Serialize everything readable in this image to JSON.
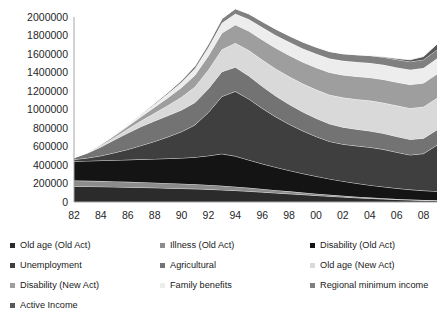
{
  "chart_data": {
    "type": "area",
    "stacked": true,
    "title": "",
    "subtitle": "",
    "xlabel": "",
    "ylabel": "",
    "grid": false,
    "legend_position": "bottom",
    "ylim": [
      0,
      2000000
    ],
    "yticks": [
      0,
      200000,
      400000,
      600000,
      800000,
      1000000,
      1200000,
      1400000,
      1600000,
      1800000,
      2000000
    ],
    "ytick_labels": [
      "0",
      "200000",
      "400000",
      "600000",
      "800000",
      "1000000",
      "1200000",
      "1400000",
      "1600000",
      "1800000",
      "2000000"
    ],
    "x": [
      1982,
      1983,
      1984,
      1985,
      1986,
      1987,
      1988,
      1989,
      1990,
      1991,
      1992,
      1993,
      1994,
      1995,
      1996,
      1997,
      1998,
      1999,
      2000,
      2001,
      2002,
      2003,
      2004,
      2005,
      2006,
      2007,
      2008,
      2009
    ],
    "xtick_labels": [
      "82",
      "84",
      "86",
      "88",
      "90",
      "92",
      "94",
      "96",
      "98",
      "00",
      "02",
      "04",
      "06",
      "08"
    ],
    "xtick_values": [
      1982,
      1984,
      1986,
      1988,
      1990,
      1992,
      1994,
      1996,
      1998,
      2000,
      2002,
      2004,
      2006,
      2008
    ],
    "series": [
      {
        "name": "Old age (Old Act)",
        "color": "#2b2b2b",
        "values": [
          170000,
          168000,
          166000,
          163000,
          160000,
          157000,
          154000,
          150000,
          146000,
          142000,
          137000,
          131000,
          124000,
          116000,
          107000,
          98000,
          89000,
          80000,
          71000,
          62000,
          54000,
          46000,
          39000,
          33000,
          27000,
          22000,
          18000,
          15000
        ]
      },
      {
        "name": "Illness (Old Act)",
        "color": "#8c8c8c",
        "values": [
          62000,
          61000,
          60000,
          59000,
          58000,
          57000,
          55000,
          54000,
          52000,
          50000,
          48000,
          45000,
          42000,
          38000,
          34000,
          30000,
          26000,
          22000,
          19000,
          16000,
          13000,
          11000,
          9000,
          7500,
          6000,
          5000,
          4000,
          3500
        ]
      },
      {
        "name": "Disability (Old Act)",
        "color": "#141414",
        "values": [
          208000,
          215000,
          222000,
          230000,
          238000,
          247000,
          256000,
          266000,
          277000,
          292000,
          315000,
          345000,
          330000,
          300000,
          272000,
          248000,
          226000,
          206000,
          188000,
          172000,
          158000,
          145000,
          134000,
          124000,
          115000,
          107000,
          101000,
          97000
        ]
      },
      {
        "name": "Unemployment",
        "color": "#3f3f3f",
        "values": [
          20000,
          32000,
          52000,
          80000,
          112000,
          150000,
          190000,
          235000,
          285000,
          350000,
          470000,
          620000,
          700000,
          660000,
          600000,
          545000,
          500000,
          462000,
          430000,
          405000,
          400000,
          405000,
          410000,
          405000,
          390000,
          375000,
          400000,
          500000
        ]
      },
      {
        "name": "Agricultural",
        "color": "#737373",
        "values": [
          18000,
          52000,
          95000,
          140000,
          178000,
          205000,
          222000,
          230000,
          235000,
          242000,
          255000,
          268000,
          262000,
          250000,
          238000,
          226000,
          215000,
          205000,
          197000,
          190000,
          184000,
          180000,
          176000,
          173000,
          170000,
          168000,
          166000,
          165000
        ]
      },
      {
        "name": "Old age (New Act)",
        "color": "#d9d9d9",
        "values": [
          2000,
          6000,
          14000,
          26000,
          42000,
          62000,
          86000,
          112000,
          140000,
          170000,
          205000,
          240000,
          262000,
          276000,
          286000,
          294000,
          300000,
          305000,
          310000,
          315000,
          320000,
          324000,
          328000,
          331000,
          334000,
          337000,
          340000,
          344000
        ]
      },
      {
        "name": "Disability (New Act)",
        "color": "#9e9e9e",
        "values": [
          1000,
          4000,
          10000,
          19000,
          31000,
          46000,
          63000,
          82000,
          103000,
          126000,
          152000,
          178000,
          196000,
          208000,
          217000,
          224000,
          230000,
          234000,
          238000,
          241000,
          244000,
          247000,
          249000,
          251000,
          253000,
          255000,
          257000,
          260000
        ]
      },
      {
        "name": "Family benefits",
        "color": "#ededed",
        "values": [
          0,
          1000,
          3000,
          7000,
          13000,
          21000,
          31000,
          43000,
          57000,
          72000,
          90000,
          108000,
          120000,
          128000,
          134000,
          139000,
          143000,
          146000,
          149000,
          151000,
          153000,
          155000,
          157000,
          158000,
          160000,
          161000,
          163000,
          166000
        ]
      },
      {
        "name": "Regional minimum income",
        "color": "#808080",
        "values": [
          0,
          0,
          1000,
          2000,
          4000,
          7000,
          11000,
          16000,
          22000,
          29000,
          38000,
          47000,
          54000,
          59000,
          63000,
          66000,
          69000,
          71000,
          73000,
          75000,
          77000,
          79000,
          81000,
          83000,
          85000,
          87000,
          90000,
          96000
        ]
      },
      {
        "name": "Active Income",
        "color": "#595959",
        "values": [
          0,
          0,
          0,
          0,
          0,
          0,
          0,
          0,
          0,
          0,
          0,
          0,
          0,
          0,
          0,
          0,
          0,
          0,
          0,
          0,
          0,
          0,
          2000,
          6000,
          12000,
          20000,
          34000,
          60000
        ]
      }
    ]
  },
  "legend": {
    "items": [
      {
        "label": "Old age (Old Act)",
        "color": "#2b2b2b"
      },
      {
        "label": "Illness (Old Act)",
        "color": "#8c8c8c"
      },
      {
        "label": "Disability (Old Act)",
        "color": "#141414"
      },
      {
        "label": "Unemployment",
        "color": "#3f3f3f"
      },
      {
        "label": "Agricultural",
        "color": "#737373"
      },
      {
        "label": "Old age (New Act)",
        "color": "#d9d9d9"
      },
      {
        "label": "Disability (New Act)",
        "color": "#9e9e9e"
      },
      {
        "label": "Family benefits",
        "color": "#ededed"
      },
      {
        "label": "Regional minimum income",
        "color": "#808080"
      },
      {
        "label": "Active Income",
        "color": "#595959"
      }
    ]
  }
}
